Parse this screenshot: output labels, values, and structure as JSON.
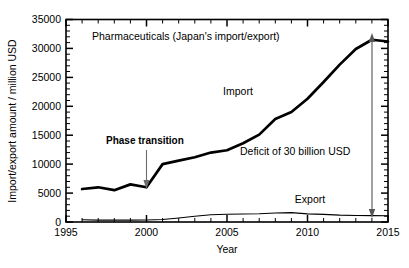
{
  "chart_data": {
    "type": "line",
    "title": "Pharmaceuticals (Japan's import/export)",
    "xlabel": "Year",
    "ylabel": "Import/export amount / million USD",
    "xlim": [
      1995,
      2015
    ],
    "ylim": [
      0,
      35000
    ],
    "x_ticks": [
      "1995",
      "2000",
      "2005",
      "2010",
      "2015"
    ],
    "x_tick_values": [
      1995,
      2000,
      2005,
      2010,
      2015
    ],
    "x_minor_step": 1,
    "y_ticks": [
      "0",
      "5000",
      "10000",
      "15000",
      "20000",
      "25000",
      "30000",
      "35000"
    ],
    "y_tick_values": [
      0,
      5000,
      10000,
      15000,
      20000,
      25000,
      30000,
      35000
    ],
    "y_minor_step": 1000,
    "grid": false,
    "legend_position": "inline-labels",
    "series": [
      {
        "name": "Import",
        "x": [
          1996,
          1997,
          1998,
          1999,
          2000,
          2001,
          2002,
          2003,
          2004,
          2005,
          2006,
          2007,
          2008,
          2009,
          2010,
          2011,
          2012,
          2013,
          2014,
          2015
        ],
        "values": [
          5700,
          6000,
          5500,
          6500,
          6000,
          10000,
          10600,
          11200,
          12000,
          12400,
          13600,
          15100,
          17800,
          19000,
          21300,
          24200,
          27200,
          29900,
          31500,
          31200
        ]
      },
      {
        "name": "Export",
        "x": [
          1996,
          1997,
          1998,
          1999,
          2000,
          2001,
          2002,
          2003,
          2004,
          2005,
          2006,
          2007,
          2008,
          2009,
          2010,
          2011,
          2012,
          2013,
          2014,
          2015
        ],
        "values": [
          400,
          330,
          330,
          330,
          350,
          420,
          700,
          1000,
          1250,
          1350,
          1380,
          1420,
          1550,
          1620,
          1400,
          1320,
          1180,
          1130,
          1100,
          1080
        ]
      }
    ],
    "annotations": [
      {
        "id": "phase-transition",
        "text": "Phase transition",
        "bold": true,
        "points_to_year": 2000,
        "points_to_value": 6000
      },
      {
        "id": "deficit",
        "text": "Deficit of 30 billion USD",
        "bold": false,
        "at_year": 2014,
        "span_from_value": 1100,
        "span_to_value": 31500
      }
    ],
    "series_labels": [
      {
        "id": "import-label",
        "text": "Import"
      },
      {
        "id": "export-label",
        "text": "Export"
      }
    ]
  },
  "colors": {
    "background": "#ffffff",
    "axis": "#000000",
    "import_line": "#000000",
    "export_line": "#000000",
    "annotation_arrow": "#6b6b6b"
  }
}
